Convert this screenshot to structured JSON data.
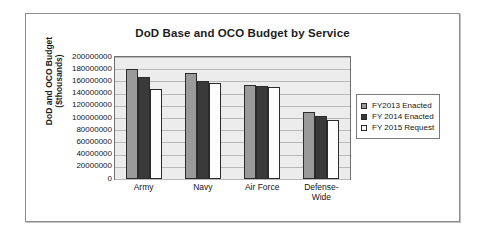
{
  "chart_data": {
    "type": "bar",
    "title": "DoD Base and OCO Budget by Service",
    "xlabel": "",
    "ylabel_line1": "DoD and OCO Budget",
    "ylabel_line2": "($thousands)",
    "categories": [
      "Army",
      "Navy",
      "Air Force",
      "Defense-Wide"
    ],
    "category_lines": [
      [
        "Army"
      ],
      [
        "Navy"
      ],
      [
        "Air Force"
      ],
      [
        "Defense-",
        "Wide"
      ]
    ],
    "series": [
      {
        "name": "FY2013 Enacted",
        "color": "#9a9a9a",
        "values": [
          180000000,
          173000000,
          154000000,
          110000000
        ]
      },
      {
        "name": "FY 2014 Enacted",
        "color": "#3a3a3a",
        "values": [
          168000000,
          161000000,
          152000000,
          103000000
        ]
      },
      {
        "name": "FY 2015 Request",
        "color": "#ffffff",
        "values": [
          148000000,
          157000000,
          151000000,
          97000000
        ]
      }
    ],
    "ylim": [
      0,
      200000000
    ],
    "ytick_step": 20000000,
    "yticks": [
      200000000,
      180000000,
      160000000,
      140000000,
      120000000,
      100000000,
      80000000,
      60000000,
      40000000,
      20000000,
      0
    ],
    "ytick_labels": [
      "200000000",
      "180000000",
      "160000000",
      "140000000",
      "120000000",
      "100000000",
      "80000000",
      "60000000",
      "40000000",
      "20000000",
      "0"
    ],
    "grid": true,
    "grid_axis": "y",
    "legend_position": "right",
    "plot_background": "#ececec"
  }
}
